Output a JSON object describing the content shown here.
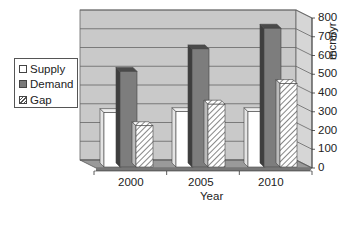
{
  "chart_data": {
    "type": "bar",
    "style": "3d-clustered-column",
    "title": "",
    "xlabel": "Year",
    "ylabel": "mcm/yr",
    "categories": [
      "2000",
      "2005",
      "2010"
    ],
    "series": [
      {
        "name": "Supply",
        "values": [
          290,
          295,
          295
        ],
        "fill": "#ffffff"
      },
      {
        "name": "Demand",
        "values": [
          510,
          630,
          740
        ],
        "fill": "#7a7a7a"
      },
      {
        "name": "Gap",
        "values": [
          220,
          335,
          445
        ],
        "fill": "hatched"
      }
    ],
    "ylim": [
      0,
      800
    ],
    "yticks": [
      0,
      100,
      200,
      300,
      400,
      500,
      600,
      700,
      800
    ],
    "grid": true,
    "legend_position": "left",
    "axis_position": "right"
  },
  "legend": {
    "items": [
      {
        "label": "Supply"
      },
      {
        "label": "Demand"
      },
      {
        "label": "Gap"
      }
    ]
  },
  "axes": {
    "x_label": "Year",
    "y_label": "mcm/yr",
    "x_ticks": [
      "2000",
      "2005",
      "2010"
    ],
    "y_ticks": [
      "0",
      "100",
      "200",
      "300",
      "400",
      "500",
      "600",
      "700",
      "800"
    ]
  }
}
